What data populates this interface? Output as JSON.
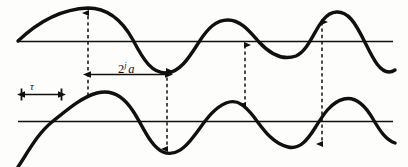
{
  "figure": {
    "background_color": "#fdfdfb",
    "stroke_color": "#101010",
    "labels": {
      "scale_prefix": "2",
      "scale_exponent": "j",
      "scale_variable": "a",
      "shift": "τ"
    },
    "axes": [
      {
        "name": "upper-baseline",
        "y": 41,
        "x_start": 18,
        "x_end": 393
      },
      {
        "name": "lower-baseline",
        "y": 121,
        "x_start": 18,
        "x_end": 393
      }
    ],
    "waveforms": [
      {
        "name": "upper-waveform",
        "baseline_y": 41,
        "path": "M 18 41 C 40 20, 62 9, 88 8 C 108 8, 122 20, 133 40 C 144 61, 152 73, 166 73 C 180 73, 190 56, 199 42 C 208 28, 216 20, 228 20 C 241 20, 250 32, 259 42 C 270 54, 282 61, 296 56 C 308 51, 314 31, 323 20 C 331 10, 342 9, 351 19 C 361 30, 368 52, 377 64 C 383 72, 389 74, 395 70"
      },
      {
        "name": "lower-waveform",
        "baseline_y": 121,
        "path": "M 18 167 C 28 152, 38 133, 52 122 C 68 109, 82 97, 97 93 C 112 89, 124 97, 133 111 C 143 126, 150 146, 163 152 C 175 157, 185 148, 194 136 C 204 123, 212 109, 226 103 C 238 98, 246 107, 254 117 C 263 129, 272 143, 288 147 C 300 150, 308 139, 315 128 C 323 115, 331 102, 344 99 C 357 96, 366 107, 373 119 C 380 131, 386 140, 395 143"
      }
    ],
    "connector_arrows": [
      {
        "name": "arrow-peak-to-peak-1",
        "x": 88,
        "y_top": 12,
        "y_bottom": 96,
        "heads": "up"
      },
      {
        "name": "arrow-trough-to-trough-1",
        "x": 167,
        "y_top": 70,
        "y_bottom": 150,
        "heads": "both"
      },
      {
        "name": "arrow-zero-to-peak",
        "x": 245,
        "y_top": 44,
        "y_bottom": 106,
        "heads": "both"
      },
      {
        "name": "arrow-peak-to-trough",
        "x": 322,
        "y_top": 21,
        "y_bottom": 145,
        "heads": "both"
      }
    ],
    "measure_bars": [
      {
        "name": "scale-measure-bar",
        "label_key": "scale",
        "y": 74,
        "x_start": 90,
        "x_end": 167,
        "style": "double-headed-horizontal"
      },
      {
        "name": "shift-measure-bar",
        "label_key": "shift",
        "y": 94,
        "x_start": 21,
        "x_end": 62,
        "style": "double-headed-horizontal-with-end-caps"
      }
    ]
  }
}
